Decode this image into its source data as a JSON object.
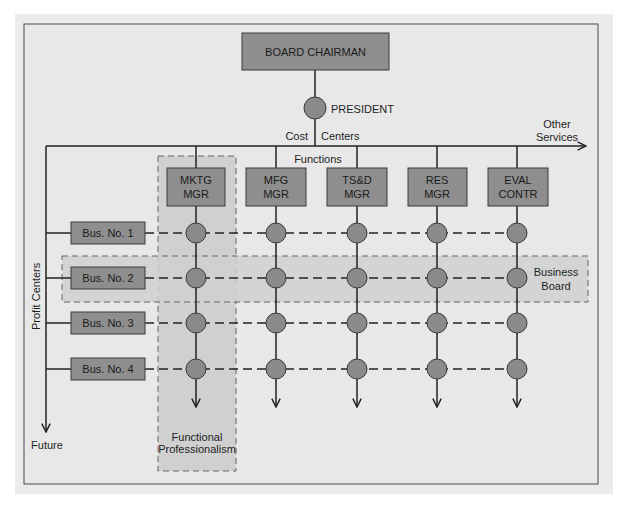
{
  "colors": {
    "panel_bg": "#e8e8e8",
    "panel_border": "#4a4a4a",
    "box_fill": "#8e8e8e",
    "box_stroke": "#3a3a3a",
    "node_fill": "#8a8a8a",
    "node_stroke": "#3a3a3a",
    "shade_fill": "#d0d0d0",
    "line": "#222222"
  },
  "top": {
    "board_chairman": "BOARD CHAIRMAN",
    "president": "PRESIDENT",
    "cost_label": "Cost",
    "centers_label": "Centers",
    "other_services_line1": "Other",
    "other_services_line2": "Services",
    "functions_label": "Functions"
  },
  "functions": [
    {
      "line1": "MKTG",
      "line2": "MGR"
    },
    {
      "line1": "MFG",
      "line2": "MGR"
    },
    {
      "line1": "TS&D",
      "line2": "MGR"
    },
    {
      "line1": "RES",
      "line2": "MGR"
    },
    {
      "line1": "EVAL",
      "line2": "CONTR"
    }
  ],
  "businesses": [
    {
      "label": "Bus. No. 1"
    },
    {
      "label": "Bus. No. 2"
    },
    {
      "label": "Bus. No. 3"
    },
    {
      "label": "Bus. No. 4"
    }
  ],
  "side": {
    "profit_centers": "Profit Centers",
    "future": "Future"
  },
  "regions": {
    "business_board_line1": "Business",
    "business_board_line2": "Board",
    "functional_line1": "Functional",
    "functional_line2": "Professionalism"
  }
}
